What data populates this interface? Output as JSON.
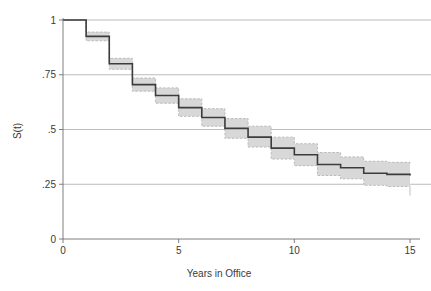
{
  "chart_data": {
    "type": "line",
    "subtype": "kaplan-meier-step-survival",
    "title": "",
    "xlabel": "Years in Office",
    "ylabel": "S(t)",
    "xlim": [
      0,
      15
    ],
    "ylim": [
      0,
      1
    ],
    "grid": "horizontal",
    "legend": "none",
    "xticks": [
      0,
      5,
      10,
      15
    ],
    "xtick_labels": [
      "0",
      "5",
      "10",
      "15"
    ],
    "yticks": [
      0,
      0.25,
      0.5,
      0.75,
      1
    ],
    "ytick_labels": [
      "0",
      ".25",
      ".5",
      ".75",
      "1"
    ],
    "x": [
      0,
      1,
      2,
      3,
      4,
      5,
      6,
      7,
      8,
      9,
      10,
      11,
      12,
      13,
      14,
      15
    ],
    "series": [
      {
        "name": "Survival estimate",
        "type": "step",
        "color": "#3c3c3c",
        "values": [
          1.0,
          0.925,
          0.8,
          0.705,
          0.655,
          0.6,
          0.555,
          0.505,
          0.465,
          0.415,
          0.385,
          0.34,
          0.325,
          0.3,
          0.295,
          0.29
        ]
      },
      {
        "name": "95% confidence interval upper",
        "type": "step-band",
        "color": "#d8d8d8",
        "values": [
          1.0,
          0.945,
          0.825,
          0.735,
          0.69,
          0.64,
          0.595,
          0.55,
          0.515,
          0.465,
          0.435,
          0.395,
          0.375,
          0.355,
          0.35,
          0.345
        ]
      },
      {
        "name": "95% confidence interval lower",
        "type": "step-band",
        "color": "#d8d8d8",
        "values": [
          1.0,
          0.905,
          0.775,
          0.675,
          0.62,
          0.56,
          0.515,
          0.46,
          0.42,
          0.365,
          0.335,
          0.29,
          0.275,
          0.245,
          0.24,
          0.235
        ]
      }
    ],
    "annotations": []
  },
  "axes": {
    "y_title": "S(t)",
    "x_title": "Years in Office",
    "y_labels": [
      "1",
      ".75",
      ".5",
      ".25",
      "0"
    ],
    "x_labels": [
      "0",
      "5",
      "10",
      "15"
    ]
  },
  "colors": {
    "line": "#3c3c3c",
    "band": "#d8d8d8",
    "band_edge": "#b5b5b5",
    "grid": "#aaaaaa",
    "axis": "#6f6f6f",
    "text": "#3a3a3a",
    "background": "#ffffff"
  }
}
